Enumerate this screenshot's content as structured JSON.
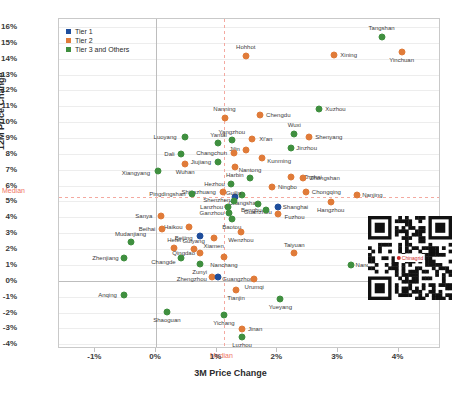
{
  "chart_data": {
    "type": "scatter",
    "title": "",
    "xlabel": "3M Price Change",
    "ylabel": "12M Price Change",
    "xlim": [
      -1.6,
      4.7
    ],
    "ylim": [
      -4.3,
      16.5
    ],
    "xticks": [
      "-1%",
      "0%",
      "1%",
      "2%",
      "3%",
      "4%"
    ],
    "xtick_values": [
      -1,
      0,
      1,
      2,
      3,
      4
    ],
    "yticks": [
      "16%",
      "15%",
      "14%",
      "13%",
      "12%",
      "11%",
      "10%",
      "9%",
      "8%",
      "7%",
      "6%",
      "5%",
      "4%",
      "3%",
      "2%",
      "1%",
      "0%",
      "-1%",
      "-2%",
      "-3%",
      "-4%"
    ],
    "ytick_values": [
      16,
      15,
      14,
      13,
      12,
      11,
      10,
      9,
      8,
      7,
      6,
      5,
      4,
      3,
      2,
      1,
      0,
      -1,
      -2,
      -3,
      -4
    ],
    "grid": true,
    "legend_position": "top-left",
    "median_x": 1.12,
    "median_y": 5.3,
    "median_label": "Median",
    "series": [
      {
        "name": "Tier 1",
        "color": "#1f4e9c"
      },
      {
        "name": "Tier 2",
        "color": "#e07b39"
      },
      {
        "name": "Tier 3 and Others",
        "color": "#3f8f3f"
      }
    ],
    "points": [
      {
        "label": "Tangshan",
        "x": 3.72,
        "y": 15.35,
        "tier": 2,
        "lx": 0,
        "ly": -9
      },
      {
        "label": "Yinchuan",
        "x": 4.05,
        "y": 14.45,
        "tier": 1,
        "lx": 0,
        "ly": 8
      },
      {
        "label": "Xining",
        "x": 2.93,
        "y": 14.25,
        "tier": 1,
        "lx": 15,
        "ly": 0
      },
      {
        "label": "Hohhot",
        "x": 1.48,
        "y": 14.18,
        "tier": 1,
        "lx": 0,
        "ly": -9
      },
      {
        "label": "Xuzhou",
        "x": 2.68,
        "y": 10.85,
        "tier": 2,
        "lx": 17,
        "ly": 0
      },
      {
        "label": "Chengdu",
        "x": 1.72,
        "y": 10.45,
        "tier": 1,
        "lx": 18,
        "ly": 0
      },
      {
        "label": "Nanning",
        "x": 1.13,
        "y": 10.25,
        "tier": 1,
        "lx": 0,
        "ly": -9
      },
      {
        "label": "Wuxi",
        "x": 2.28,
        "y": 9.25,
        "tier": 2,
        "lx": 0,
        "ly": -9
      },
      {
        "label": "Shenyang",
        "x": 2.52,
        "y": 9.05,
        "tier": 1,
        "lx": 20,
        "ly": 0
      },
      {
        "label": "Luoyang",
        "x": 0.48,
        "y": 9.05,
        "tier": 2,
        "lx": -20,
        "ly": 0
      },
      {
        "label": "Xi'an",
        "x": 1.58,
        "y": 8.95,
        "tier": 1,
        "lx": 14,
        "ly": 0
      },
      {
        "label": "Yangzhou",
        "x": 1.25,
        "y": 8.85,
        "tier": 2,
        "lx": 0,
        "ly": -8
      },
      {
        "label": "Yantai",
        "x": 1.03,
        "y": 8.68,
        "tier": 2,
        "lx": 0,
        "ly": -8
      },
      {
        "label": "Jinzhou",
        "x": 2.22,
        "y": 8.38,
        "tier": 2,
        "lx": 16,
        "ly": 0
      },
      {
        "label": "Jilin",
        "x": 1.48,
        "y": 8.25,
        "tier": 1,
        "lx": -11,
        "ly": -1
      },
      {
        "label": "Changchun",
        "x": 1.28,
        "y": 8.05,
        "tier": 1,
        "lx": -22,
        "ly": 0
      },
      {
        "label": "Dali",
        "x": 0.42,
        "y": 8.02,
        "tier": 2,
        "lx": -12,
        "ly": 0
      },
      {
        "label": "Kunming",
        "x": 1.75,
        "y": 7.75,
        "tier": 1,
        "lx": 17,
        "ly": 3
      },
      {
        "label": "Jiujiang",
        "x": 1.02,
        "y": 7.48,
        "tier": 2,
        "lx": -17,
        "ly": 0
      },
      {
        "label": "Wuhan",
        "x": 0.48,
        "y": 7.38,
        "tier": 1,
        "lx": 0,
        "ly": 8
      },
      {
        "label": "Harbin",
        "x": 1.3,
        "y": 7.15,
        "tier": 1,
        "lx": 0,
        "ly": 8
      },
      {
        "label": "Xiangyang",
        "x": 0.03,
        "y": 6.92,
        "tier": 2,
        "lx": -22,
        "ly": 2
      },
      {
        "label": "Zhuhai",
        "x": 2.22,
        "y": 6.55,
        "tier": 1,
        "lx": 22,
        "ly": 0
      },
      {
        "label": "Zhongshan",
        "x": 2.42,
        "y": 6.5,
        "tier": 1,
        "lx": 22,
        "ly": 0
      },
      {
        "label": "Nantong",
        "x": 1.55,
        "y": 6.48,
        "tier": 2,
        "lx": 0,
        "ly": -8
      },
      {
        "label": "Hezhou",
        "x": 1.23,
        "y": 6.08,
        "tier": 2,
        "lx": -16,
        "ly": 0
      },
      {
        "label": "Ningbo",
        "x": 1.92,
        "y": 5.88,
        "tier": 1,
        "lx": 15,
        "ly": 0
      },
      {
        "label": "Chongqing",
        "x": 2.48,
        "y": 5.6,
        "tier": 1,
        "lx": 20,
        "ly": 0
      },
      {
        "label": "Shijiazhuang",
        "x": 1.1,
        "y": 5.62,
        "tier": 1,
        "lx": -24,
        "ly": 0
      },
      {
        "label": "Pingdingshan",
        "x": 0.6,
        "y": 5.48,
        "tier": 2,
        "lx": -25,
        "ly": 0
      },
      {
        "label": "Changsha",
        "x": 1.42,
        "y": 5.42,
        "tier": 2,
        "lx": 0,
        "ly": 8
      },
      {
        "label": "Nanjing",
        "x": 3.32,
        "y": 5.42,
        "tier": 1,
        "lx": 15,
        "ly": 0
      },
      {
        "label": "Shenzhen",
        "x": 1.3,
        "y": 5.25,
        "tier": 0,
        "lx": -18,
        "ly": 3
      },
      {
        "label": "Guilin",
        "x": 1.28,
        "y": 5.05,
        "tier": 2,
        "lx": 0,
        "ly": -8
      },
      {
        "label": "Hangzhou",
        "x": 2.88,
        "y": 4.95,
        "tier": 1,
        "lx": 0,
        "ly": 8
      },
      {
        "label": "Guanzhou",
        "x": 1.68,
        "y": 4.82,
        "tier": 2,
        "lx": 0,
        "ly": 8
      },
      {
        "label": "Lanzhou",
        "x": 1.18,
        "y": 4.62,
        "tier": 2,
        "lx": -16,
        "ly": 0
      },
      {
        "label": "Shanghai",
        "x": 2.02,
        "y": 4.62,
        "tier": 0,
        "lx": 17,
        "ly": 0
      },
      {
        "label": "Bengbu",
        "x": 1.82,
        "y": 4.48,
        "tier": 2,
        "lx": -15,
        "ly": 0
      },
      {
        "label": "Ganzhou",
        "x": 1.2,
        "y": 4.25,
        "tier": 2,
        "lx": -17,
        "ly": 0
      },
      {
        "label": "Fuzhou",
        "x": 2.02,
        "y": 4.18,
        "tier": 1,
        "lx": 16,
        "ly": 3
      },
      {
        "label": "Sanya",
        "x": 0.08,
        "y": 4.08,
        "tier": 1,
        "lx": -17,
        "ly": 0
      },
      {
        "label": "Baotou",
        "x": 1.25,
        "y": 3.92,
        "tier": 2,
        "lx": 0,
        "ly": 8
      },
      {
        "label": "Haikou",
        "x": 0.55,
        "y": 3.38,
        "tier": 1,
        "lx": -16,
        "ly": 0
      },
      {
        "label": "Beihai",
        "x": 0.1,
        "y": 3.28,
        "tier": 1,
        "lx": -15,
        "ly": 0
      },
      {
        "label": "Wenzhou",
        "x": 1.4,
        "y": 3.08,
        "tier": 1,
        "lx": 0,
        "ly": 8
      },
      {
        "label": "Beijing",
        "x": 0.72,
        "y": 2.85,
        "tier": 0,
        "lx": -16,
        "ly": 2
      },
      {
        "label": "Xiamen",
        "x": 0.95,
        "y": 2.72,
        "tier": 1,
        "lx": 0,
        "ly": 8
      },
      {
        "label": "Mudanjiang",
        "x": -0.42,
        "y": 2.42,
        "tier": 2,
        "lx": 0,
        "ly": -8
      },
      {
        "label": "Hefei",
        "x": 0.3,
        "y": 2.08,
        "tier": 1,
        "lx": 0,
        "ly": -8
      },
      {
        "label": "Guiyang",
        "x": 0.62,
        "y": 2.02,
        "tier": 1,
        "lx": 0,
        "ly": -8
      },
      {
        "label": "Qingdao",
        "x": 0.72,
        "y": 1.78,
        "tier": 1,
        "lx": -16,
        "ly": 0
      },
      {
        "label": "Taiyuan",
        "x": 2.28,
        "y": 1.72,
        "tier": 1,
        "lx": 0,
        "ly": -8
      },
      {
        "label": "Nanchang",
        "x": 1.12,
        "y": 1.52,
        "tier": 1,
        "lx": 0,
        "ly": 8
      },
      {
        "label": "Zhenjiang",
        "x": -0.52,
        "y": 1.45,
        "tier": 2,
        "lx": -19,
        "ly": 0
      },
      {
        "label": "Changde",
        "x": 0.42,
        "y": 1.42,
        "tier": 2,
        "lx": -18,
        "ly": 4
      },
      {
        "label": "Zunyi",
        "x": 0.72,
        "y": 1.05,
        "tier": 2,
        "lx": 0,
        "ly": 8
      },
      {
        "label": "Nanchong",
        "x": 3.22,
        "y": 0.98,
        "tier": 2,
        "lx": 18,
        "ly": 0
      },
      {
        "label": "Zhengzhou",
        "x": 0.92,
        "y": 0.22,
        "tier": 1,
        "lx": -20,
        "ly": 2
      },
      {
        "label": "Guangzhou",
        "x": 1.02,
        "y": 0.22,
        "tier": 0,
        "lx": 20,
        "ly": 2
      },
      {
        "label": "Urumqi",
        "x": 1.62,
        "y": 0.12,
        "tier": 1,
        "lx": 0,
        "ly": 8
      },
      {
        "label": "Tianjin",
        "x": 1.32,
        "y": -0.58,
        "tier": 1,
        "lx": 0,
        "ly": 8
      },
      {
        "label": "Anqing",
        "x": -0.52,
        "y": -0.88,
        "tier": 2,
        "lx": -17,
        "ly": 0
      },
      {
        "label": "Yueyang",
        "x": 2.05,
        "y": -1.15,
        "tier": 2,
        "lx": 0,
        "ly": 8
      },
      {
        "label": "Shaoguan",
        "x": 0.18,
        "y": -1.95,
        "tier": 2,
        "lx": 0,
        "ly": 8
      },
      {
        "label": "Yichang",
        "x": 1.12,
        "y": -2.18,
        "tier": 2,
        "lx": 0,
        "ly": 8
      },
      {
        "label": "Jinan",
        "x": 1.42,
        "y": -3.05,
        "tier": 1,
        "lx": 13,
        "ly": 0
      },
      {
        "label": "Luzhou",
        "x": 1.42,
        "y": -3.55,
        "tier": 2,
        "lx": 0,
        "ly": 8
      }
    ]
  },
  "qr": {
    "logo_text": "Chinagrid"
  }
}
